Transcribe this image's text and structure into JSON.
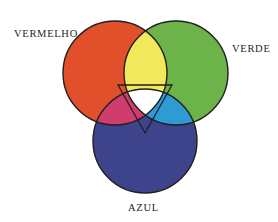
{
  "diagram": {
    "kind": "additive-color-venn-diagram",
    "background_color": "#FFFFFF",
    "outline_color": "#231E20",
    "outline_width": 1.4,
    "labels": {
      "red_label": "VERMELHO",
      "green_label": "VERDE",
      "blue_label": "AZUL",
      "label_color": "#241F24"
    },
    "circles": [
      {
        "name": "red-circle",
        "label": "VERMELHO",
        "color": "#E1502A",
        "cx": 115,
        "cy": 73,
        "r": 52
      },
      {
        "name": "green-circle",
        "label": "VERDE",
        "color": "#6CB44A",
        "cx": 176,
        "cy": 73,
        "r": 52
      },
      {
        "name": "blue-circle",
        "label": "AZUL",
        "color": "#3E448C",
        "cx": 145,
        "cy": 141,
        "r": 52
      }
    ],
    "overlaps": [
      {
        "name": "red-green-overlap",
        "mix_of": "VERMELHO + VERDE",
        "result": "AMARELO",
        "color": "#F2E85C"
      },
      {
        "name": "red-blue-overlap",
        "mix_of": "VERMELHO + AZUL",
        "result": "MAGENTA",
        "color": "#CE3D6E"
      },
      {
        "name": "green-blue-overlap",
        "mix_of": "VERDE + AZUL",
        "result": "CIANO",
        "color": "#2E9BD4"
      },
      {
        "name": "center-triple-overlap",
        "mix_of": "VERMELHO + VERDE + AZUL",
        "result": "BRANCO",
        "color": "#FFFFFF"
      }
    ],
    "center_triangle": {
      "name": "inscribed-triangle",
      "vertices": [
        {
          "x": 118,
          "y": 85
        },
        {
          "x": 172,
          "y": 85
        },
        {
          "x": 145,
          "y": 133
        }
      ],
      "stroke": "#231E20",
      "fill": "none"
    }
  }
}
